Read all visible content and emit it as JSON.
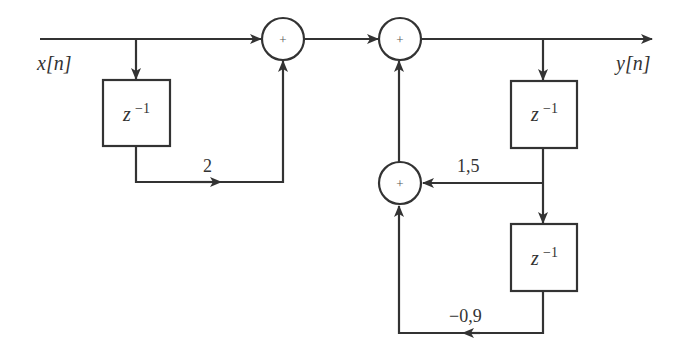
{
  "diagram": {
    "type": "block-diagram",
    "input_label": "x[n]",
    "output_label": "y[n]",
    "delays": [
      {
        "id": "delay-1",
        "label_base": "z",
        "label_exp": "−1"
      },
      {
        "id": "delay-2",
        "label_base": "z",
        "label_exp": "−1"
      },
      {
        "id": "delay-3",
        "label_base": "z",
        "label_exp": "−1"
      }
    ],
    "adders": [
      {
        "id": "adder-1",
        "symbol": "+"
      },
      {
        "id": "adder-2",
        "symbol": "+"
      },
      {
        "id": "adder-3",
        "symbol": "+"
      }
    ],
    "gains": [
      {
        "id": "gain-feedforward",
        "value": "2"
      },
      {
        "id": "gain-feedback-1",
        "value": "1,5"
      },
      {
        "id": "gain-feedback-2",
        "value": "−0,9"
      }
    ],
    "colors": {
      "stroke": "#333333",
      "background": "#ffffff"
    }
  }
}
